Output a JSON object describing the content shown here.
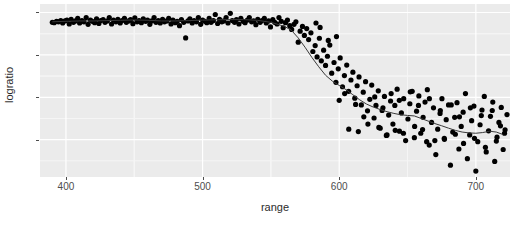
{
  "chart_data": {
    "type": "scatter",
    "title": "",
    "subtitle": "",
    "xlabel": "range",
    "ylabel": "logratio",
    "xlim": [
      381,
      725
    ],
    "ylim": [
      -0.97,
      0.05
    ],
    "xticks": [
      400,
      500,
      600,
      700
    ],
    "xtick_labels": [
      "400",
      "500",
      "600",
      "700"
    ],
    "yticks": [
      0.0,
      -0.25,
      -0.5,
      -0.75
    ],
    "ytick_labels": [
      "0.00",
      "-0.25",
      "-0.50",
      "-0.75"
    ],
    "grid": true,
    "grid_major_color": "#ffffff",
    "grid_minor_color": "#f5f5f5",
    "panel_background": "#ebebeb",
    "plot_background": "#ffffff",
    "legend": null,
    "legend_position": "none",
    "point_color": "#000000",
    "point_size": 2.6,
    "smoother": {
      "name": "loess-smoother",
      "color": "#3a3a3a",
      "width": 1.0,
      "x": [
        390,
        400,
        410,
        420,
        430,
        440,
        450,
        460,
        470,
        480,
        490,
        500,
        510,
        520,
        530,
        540,
        550,
        560,
        565,
        570,
        575,
        580,
        585,
        590,
        595,
        600,
        605,
        610,
        615,
        620,
        625,
        630,
        635,
        640,
        645,
        650,
        655,
        660,
        665,
        670,
        675,
        680,
        685,
        690,
        695,
        700,
        705,
        710,
        715,
        720
      ],
      "y": [
        -0.055,
        -0.052,
        -0.05,
        -0.05,
        -0.048,
        -0.046,
        -0.044,
        -0.046,
        -0.05,
        -0.05,
        -0.048,
        -0.045,
        -0.043,
        -0.042,
        -0.042,
        -0.046,
        -0.058,
        -0.082,
        -0.105,
        -0.15,
        -0.205,
        -0.265,
        -0.32,
        -0.37,
        -0.405,
        -0.43,
        -0.455,
        -0.485,
        -0.515,
        -0.54,
        -0.558,
        -0.572,
        -0.585,
        -0.595,
        -0.603,
        -0.607,
        -0.61,
        -0.625,
        -0.64,
        -0.655,
        -0.668,
        -0.682,
        -0.695,
        -0.705,
        -0.71,
        -0.712,
        -0.708,
        -0.7,
        -0.705,
        -0.72
      ]
    },
    "series": [
      {
        "name": "logratio",
        "points": [
          [
            390.0,
            -0.058
          ],
          [
            391.4,
            -0.06
          ],
          [
            393.1,
            -0.052
          ],
          [
            394.5,
            -0.055
          ],
          [
            396.2,
            -0.048
          ],
          [
            397.6,
            -0.062
          ],
          [
            399.3,
            -0.05
          ],
          [
            400.7,
            -0.045
          ],
          [
            402.4,
            -0.068
          ],
          [
            403.8,
            -0.04
          ],
          [
            405.5,
            -0.058
          ],
          [
            406.9,
            -0.05
          ],
          [
            408.6,
            -0.035
          ],
          [
            410.0,
            -0.062
          ],
          [
            411.7,
            -0.048
          ],
          [
            413.1,
            -0.055
          ],
          [
            414.8,
            -0.03
          ],
          [
            416.2,
            -0.07
          ],
          [
            417.9,
            -0.045
          ],
          [
            419.3,
            -0.052
          ],
          [
            421.0,
            -0.06
          ],
          [
            422.4,
            -0.038
          ],
          [
            424.1,
            -0.065
          ],
          [
            425.5,
            -0.048
          ],
          [
            427.2,
            -0.042
          ],
          [
            428.6,
            -0.058
          ],
          [
            430.3,
            -0.05
          ],
          [
            431.7,
            -0.03
          ],
          [
            433.4,
            -0.068
          ],
          [
            434.8,
            -0.045
          ],
          [
            436.6,
            -0.055
          ],
          [
            438.0,
            -0.04
          ],
          [
            439.7,
            -0.062
          ],
          [
            441.1,
            -0.048
          ],
          [
            442.8,
            -0.035
          ],
          [
            444.2,
            -0.058
          ],
          [
            445.9,
            -0.05
          ],
          [
            447.3,
            -0.042
          ],
          [
            449.0,
            -0.066
          ],
          [
            450.4,
            -0.032
          ],
          [
            452.1,
            -0.055
          ],
          [
            453.5,
            -0.048
          ],
          [
            455.2,
            -0.06
          ],
          [
            456.6,
            -0.038
          ],
          [
            458.3,
            -0.052
          ],
          [
            459.7,
            -0.045
          ],
          [
            461.4,
            -0.07
          ],
          [
            462.8,
            -0.05
          ],
          [
            464.5,
            -0.03
          ],
          [
            465.9,
            -0.058
          ],
          [
            467.6,
            -0.048
          ],
          [
            469.0,
            -0.062
          ],
          [
            470.7,
            -0.04
          ],
          [
            472.1,
            -0.055
          ],
          [
            473.8,
            -0.05
          ],
          [
            475.2,
            -0.035
          ],
          [
            476.9,
            -0.068
          ],
          [
            478.3,
            -0.045
          ],
          [
            480.0,
            -0.06
          ],
          [
            481.4,
            -0.052
          ],
          [
            483.1,
            -0.078
          ],
          [
            484.5,
            -0.042
          ],
          [
            486.2,
            -0.058
          ],
          [
            487.6,
            -0.15
          ],
          [
            489.3,
            -0.05
          ],
          [
            490.7,
            -0.038
          ],
          [
            492.4,
            -0.062
          ],
          [
            493.8,
            -0.048
          ],
          [
            495.5,
            -0.055
          ],
          [
            496.9,
            -0.03
          ],
          [
            498.6,
            -0.07
          ],
          [
            500.0,
            -0.045
          ],
          [
            501.7,
            -0.052
          ],
          [
            503.1,
            -0.06
          ],
          [
            504.8,
            -0.035
          ],
          [
            506.2,
            -0.058
          ],
          [
            507.9,
            -0.048
          ],
          [
            509.3,
            -0.012
          ],
          [
            511.0,
            -0.065
          ],
          [
            512.4,
            -0.04
          ],
          [
            514.1,
            -0.055
          ],
          [
            515.5,
            -0.05
          ],
          [
            517.2,
            -0.03
          ],
          [
            518.6,
            -0.062
          ],
          [
            520.3,
            -0.005
          ],
          [
            521.7,
            -0.048
          ],
          [
            523.4,
            -0.058
          ],
          [
            524.8,
            -0.042
          ],
          [
            526.6,
            -0.068
          ],
          [
            528.0,
            -0.035
          ],
          [
            529.7,
            -0.052
          ],
          [
            531.1,
            -0.06
          ],
          [
            532.8,
            -0.045
          ],
          [
            534.2,
            -0.03
          ],
          [
            535.9,
            -0.055
          ],
          [
            537.3,
            -0.05
          ],
          [
            539.0,
            -0.072
          ],
          [
            540.4,
            -0.04
          ],
          [
            542.1,
            -0.058
          ],
          [
            543.5,
            -0.048
          ],
          [
            545.2,
            -0.035
          ],
          [
            546.6,
            -0.062
          ],
          [
            548.3,
            -0.05
          ],
          [
            549.7,
            -0.085
          ],
          [
            551.4,
            -0.042
          ],
          [
            552.8,
            -0.058
          ],
          [
            554.5,
            -0.068
          ],
          [
            555.9,
            -0.03
          ],
          [
            557.6,
            -0.052
          ],
          [
            559.0,
            -0.09
          ],
          [
            560.7,
            -0.06
          ],
          [
            562.1,
            -0.045
          ],
          [
            563.8,
            -0.078
          ],
          [
            565.2,
            -0.1
          ],
          [
            566.9,
            -0.07
          ],
          [
            568.3,
            -0.055
          ],
          [
            570.0,
            -0.175
          ],
          [
            571.4,
            -0.11
          ],
          [
            573.1,
            -0.082
          ],
          [
            574.5,
            -0.135
          ],
          [
            576.2,
            -0.095
          ],
          [
            577.6,
            -0.16
          ],
          [
            579.3,
            -0.12
          ],
          [
            580.7,
            -0.23
          ],
          [
            582.4,
            -0.195
          ],
          [
            583.8,
            -0.262
          ],
          [
            585.5,
            -0.152
          ],
          [
            586.9,
            -0.285
          ],
          [
            588.6,
            -0.222
          ],
          [
            590.0,
            -0.312
          ],
          [
            591.4,
            -0.258
          ],
          [
            593.1,
            -0.192
          ],
          [
            594.5,
            -0.358
          ],
          [
            596.2,
            -0.295
          ],
          [
            597.6,
            -0.412
          ],
          [
            599.3,
            -0.332
          ],
          [
            600.7,
            -0.268
          ],
          [
            602.4,
            -0.438
          ],
          [
            603.8,
            -0.372
          ],
          [
            605.5,
            -0.31
          ],
          [
            606.9,
            -0.465
          ],
          [
            608.6,
            -0.398
          ],
          [
            610.0,
            -0.352
          ],
          [
            611.4,
            -0.505
          ],
          [
            613.1,
            -0.432
          ],
          [
            614.5,
            -0.38
          ],
          [
            616.2,
            -0.545
          ],
          [
            617.6,
            -0.47
          ],
          [
            619.3,
            -0.408
          ],
          [
            620.7,
            -0.58
          ],
          [
            622.4,
            -0.512
          ],
          [
            623.8,
            -0.428
          ],
          [
            625.5,
            -0.622
          ],
          [
            626.9,
            -0.548
          ],
          [
            628.6,
            -0.462
          ],
          [
            630.0,
            -0.682
          ],
          [
            631.4,
            -0.578
          ],
          [
            633.1,
            -0.495
          ],
          [
            634.5,
            -0.725
          ],
          [
            636.2,
            -0.605
          ],
          [
            637.6,
            -0.522
          ],
          [
            639.3,
            -0.658
          ],
          [
            640.7,
            -0.548
          ],
          [
            642.4,
            -0.452
          ],
          [
            644.1,
            -0.7
          ],
          [
            645.5,
            -0.592
          ],
          [
            647.2,
            -0.508
          ],
          [
            648.6,
            -0.755
          ],
          [
            650.3,
            -0.628
          ],
          [
            651.7,
            -0.538
          ],
          [
            653.4,
            -0.465
          ],
          [
            655.2,
            -0.672
          ],
          [
            656.6,
            -0.582
          ],
          [
            658.3,
            -0.492
          ],
          [
            659.7,
            -0.712
          ],
          [
            661.4,
            -0.618
          ],
          [
            662.8,
            -0.528
          ],
          [
            664.5,
            -0.455
          ],
          [
            665.9,
            -0.782
          ],
          [
            667.6,
            -0.648
          ],
          [
            669.0,
            -0.562
          ],
          [
            670.7,
            -0.838
          ],
          [
            672.1,
            -0.688
          ],
          [
            673.8,
            -0.595
          ],
          [
            675.2,
            -0.508
          ],
          [
            676.9,
            -0.742
          ],
          [
            678.3,
            -0.632
          ],
          [
            680.0,
            -0.545
          ],
          [
            681.4,
            -0.9
          ],
          [
            683.1,
            -0.705
          ],
          [
            684.5,
            -0.618
          ],
          [
            686.2,
            -0.532
          ],
          [
            687.6,
            -0.805
          ],
          [
            689.3,
            -0.672
          ],
          [
            690.7,
            -0.588
          ],
          [
            692.4,
            -0.478
          ],
          [
            693.8,
            -0.862
          ],
          [
            695.5,
            -0.722
          ],
          [
            696.9,
            -0.638
          ],
          [
            698.6,
            -0.552
          ],
          [
            700.0,
            -0.935
          ],
          [
            701.4,
            -0.762
          ],
          [
            703.1,
            -0.662
          ],
          [
            704.5,
            -0.575
          ],
          [
            706.2,
            -0.495
          ],
          [
            707.6,
            -0.822
          ],
          [
            709.3,
            -0.698
          ],
          [
            710.7,
            -0.612
          ],
          [
            712.4,
            -0.528
          ],
          [
            713.8,
            -0.878
          ],
          [
            715.5,
            -0.735
          ],
          [
            716.9,
            -0.648
          ],
          [
            718.6,
            -0.56
          ],
          [
            720.0,
            -0.808
          ],
          [
            721.4,
            -0.692
          ],
          [
            722.8,
            -0.602
          ],
          [
            600.0,
            -0.518
          ],
          [
            604.0,
            -0.478
          ],
          [
            612.0,
            -0.542
          ],
          [
            618.0,
            -0.615
          ],
          [
            626.0,
            -0.498
          ],
          [
            632.0,
            -0.562
          ],
          [
            638.0,
            -0.478
          ],
          [
            644.0,
            -0.518
          ],
          [
            652.0,
            -0.468
          ],
          [
            658.0,
            -0.548
          ],
          [
            666.0,
            -0.508
          ],
          [
            674.0,
            -0.578
          ],
          [
            682.0,
            -0.545
          ],
          [
            688.0,
            -0.615
          ],
          [
            696.0,
            -0.562
          ],
          [
            704.0,
            -0.608
          ],
          [
            712.0,
            -0.578
          ],
          [
            718.0,
            -0.668
          ],
          [
            664.0,
            -0.762
          ],
          [
            670.0,
            -0.755
          ],
          [
            607.0,
            -0.688
          ],
          [
            614.0,
            -0.702
          ],
          [
            621.0,
            -0.658
          ],
          [
            629.0,
            -0.678
          ],
          [
            635.0,
            -0.722
          ],
          [
            641.0,
            -0.695
          ],
          [
            647.0,
            -0.712
          ],
          [
            655.0,
            -0.738
          ],
          [
            661.0,
            -0.69
          ],
          [
            677.0,
            -0.748
          ],
          [
            685.0,
            -0.718
          ],
          [
            691.0,
            -0.772
          ],
          [
            699.0,
            -0.742
          ],
          [
            707.0,
            -0.795
          ],
          [
            715.0,
            -0.758
          ],
          [
            721.0,
            -0.712
          ],
          [
            586.0,
            -0.088
          ],
          [
            592.0,
            -0.165
          ],
          [
            598.0,
            -0.142
          ],
          [
            583.0,
            -0.062
          ]
        ]
      }
    ]
  },
  "axis_text_color": "#4d4d4d",
  "axis_title_color": "#2b2b2b"
}
